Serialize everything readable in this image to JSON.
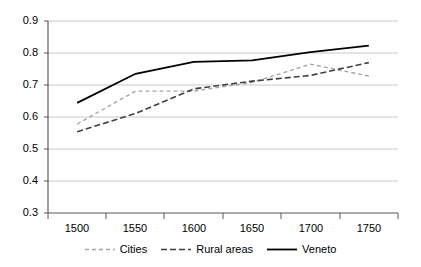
{
  "chart_data": {
    "type": "line",
    "title": "",
    "xlabel": "",
    "ylabel": "",
    "categories": [
      "1500",
      "1550",
      "1600",
      "1650",
      "1700",
      "1750"
    ],
    "x": [
      1500,
      1550,
      1600,
      1650,
      1700,
      1750
    ],
    "ylim": [
      0.3,
      0.9
    ],
    "yticks": [
      "0.3",
      "0.4",
      "0.5",
      "0.6",
      "0.7",
      "0.8",
      "0.9"
    ],
    "ytick_values": [
      0.3,
      0.4,
      0.5,
      0.6,
      0.7,
      0.8,
      0.9
    ],
    "grid": "horizontal",
    "legend_position": "bottom",
    "series": [
      {
        "name": "Cities",
        "values": [
          0.578,
          0.681,
          0.681,
          0.708,
          0.765,
          0.728
        ],
        "style": "dotted-dashed",
        "color": "#a6a6a6"
      },
      {
        "name": "Rural areas",
        "values": [
          0.554,
          0.611,
          0.688,
          0.712,
          0.73,
          0.77
        ],
        "style": "dashed",
        "color": "#3f3f3f"
      },
      {
        "name": "Veneto",
        "values": [
          0.644,
          0.735,
          0.772,
          0.777,
          0.803,
          0.823
        ],
        "style": "solid",
        "color": "#000000"
      }
    ]
  },
  "axis": {
    "y_labels": [
      "0.9",
      "0.8",
      "0.7",
      "0.6",
      "0.5",
      "0.4",
      "0.3"
    ],
    "x_labels": [
      "1500",
      "1550",
      "1600",
      "1650",
      "1700",
      "1750"
    ]
  },
  "legend": {
    "items": [
      {
        "label": "Cities",
        "swatch": "dotted-line-swatch"
      },
      {
        "label": "Rural areas",
        "swatch": "dashed-line-swatch"
      },
      {
        "label": "Veneto",
        "swatch": "solid-line-swatch"
      }
    ]
  },
  "colors": {
    "cities": "#a6a6a6",
    "rural": "#3f3f3f",
    "veneto": "#000000",
    "grid": "#c8c8c8",
    "axis": "#808080"
  }
}
